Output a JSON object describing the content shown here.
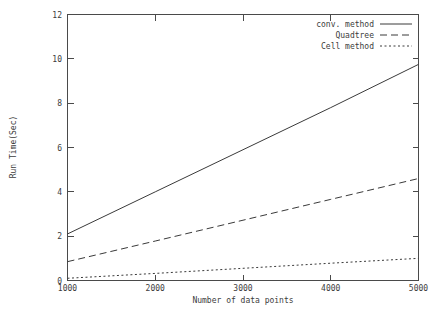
{
  "chart_data": {
    "type": "line",
    "title": "",
    "xlabel": "Number of data points",
    "ylabel": "Run Time(Sec)",
    "xlim": [
      1000,
      5000
    ],
    "ylim": [
      0,
      12
    ],
    "xticks": [
      1000,
      2000,
      3000,
      4000,
      5000
    ],
    "yticks": [
      0,
      2,
      4,
      6,
      8,
      10,
      12
    ],
    "xtick_labels": [
      "1000",
      "2000",
      "3000",
      "4000",
      "5000"
    ],
    "ytick_labels": [
      "0",
      "2",
      "4",
      "6",
      "8",
      "10",
      "12"
    ],
    "grid": false,
    "legend_position": "upper right (inside axes)",
    "x": [
      1000,
      2000,
      3000,
      4000,
      5000
    ],
    "series": [
      {
        "name": "conv. method",
        "style": "solid",
        "color": "#3a3a3a",
        "values": [
          2.1,
          4.0,
          5.9,
          7.8,
          9.75
        ]
      },
      {
        "name": "Quadtree",
        "style": "dashed",
        "color": "#3a3a3a",
        "values": [
          0.85,
          1.78,
          2.72,
          3.66,
          4.6
        ]
      },
      {
        "name": "Cell method",
        "style": "dotted",
        "color": "#3a3a3a",
        "values": [
          0.1,
          0.32,
          0.55,
          0.78,
          1.0
        ]
      }
    ]
  },
  "axes": {
    "xlabel": "Number of data points",
    "ylabel": "Run Time(Sec)",
    "xtick_labels": [
      "1000",
      "2000",
      "3000",
      "4000",
      "5000"
    ],
    "ytick_labels": [
      "0",
      "2",
      "4",
      "6",
      "8",
      "10",
      "12"
    ]
  },
  "legend": {
    "entries": [
      {
        "label": "conv. method",
        "style": "solid"
      },
      {
        "label": "Quadtree",
        "style": "dashed"
      },
      {
        "label": "Cell method",
        "style": "dotted"
      }
    ]
  }
}
